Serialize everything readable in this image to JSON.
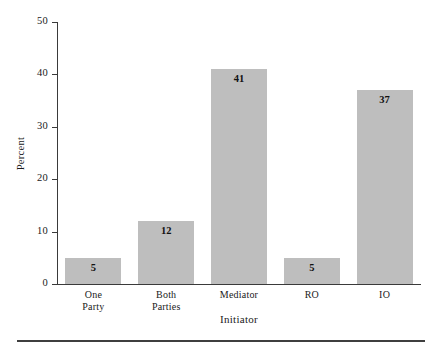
{
  "chart_data": {
    "type": "bar",
    "title": "",
    "subtitle": "",
    "xlabel": "Initiator",
    "ylabel": "Percent",
    "categories": [
      "One Party",
      "Both Parties",
      "Mediator",
      "RO",
      "IO"
    ],
    "category_lines": [
      [
        "One",
        "Party"
      ],
      [
        "Both",
        "Parties"
      ],
      [
        "Mediator"
      ],
      [
        "RO"
      ],
      [
        "IO"
      ]
    ],
    "values": [
      5,
      12,
      41,
      5,
      37
    ],
    "data_labels": [
      "5",
      "12",
      "41",
      "5",
      "37"
    ],
    "ylim": [
      0,
      50
    ],
    "yticks": [
      0,
      10,
      20,
      30,
      40,
      50
    ],
    "ytick_labels": [
      "0",
      "10",
      "20",
      "30",
      "40",
      "50"
    ],
    "grid": false,
    "legend": null,
    "bar_color": "#bebebe",
    "axis_color": "#3a3a3a",
    "text_color": "#1a1a1a"
  },
  "footer": {
    "rule": ""
  }
}
